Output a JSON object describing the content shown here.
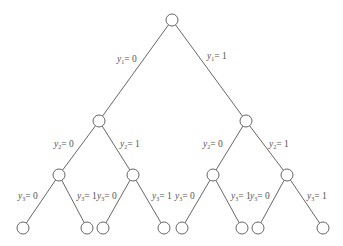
{
  "diagram": {
    "type": "binary-tree",
    "nodes": [
      {
        "id": "root",
        "x": 172,
        "y": 20
      },
      {
        "id": "L",
        "x": 99,
        "y": 121
      },
      {
        "id": "R",
        "x": 246,
        "y": 121
      },
      {
        "id": "LL",
        "x": 59,
        "y": 175
      },
      {
        "id": "LR",
        "x": 133,
        "y": 175
      },
      {
        "id": "RL",
        "x": 213,
        "y": 175
      },
      {
        "id": "RR",
        "x": 287,
        "y": 175
      },
      {
        "id": "LLL",
        "x": 23,
        "y": 228
      },
      {
        "id": "LLR",
        "x": 87,
        "y": 228
      },
      {
        "id": "LRL",
        "x": 103,
        "y": 228
      },
      {
        "id": "LRR",
        "x": 164,
        "y": 228
      },
      {
        "id": "RLL",
        "x": 182,
        "y": 228
      },
      {
        "id": "RLR",
        "x": 242,
        "y": 228
      },
      {
        "id": "RRL",
        "x": 258,
        "y": 228
      },
      {
        "id": "RRR",
        "x": 323,
        "y": 228
      }
    ],
    "edges": [
      {
        "from": "root",
        "to": "L",
        "var": "y",
        "sub": "1",
        "val": "= 0",
        "lx": 117,
        "ly": 55
      },
      {
        "from": "root",
        "to": "R",
        "var": "y",
        "sub": "1",
        "val": "= 1",
        "lx": 207,
        "ly": 52
      },
      {
        "from": "L",
        "to": "LL",
        "var": "y",
        "sub": "2",
        "val": "= 0",
        "lx": 54,
        "ly": 140
      },
      {
        "from": "L",
        "to": "LR",
        "var": "y",
        "sub": "2",
        "val": "= 1",
        "lx": 120,
        "ly": 140
      },
      {
        "from": "R",
        "to": "RL",
        "var": "y",
        "sub": "2",
        "val": "= 0",
        "lx": 203,
        "ly": 140
      },
      {
        "from": "R",
        "to": "RR",
        "var": "y",
        "sub": "2",
        "val": "= 1",
        "lx": 269,
        "ly": 140
      },
      {
        "from": "LL",
        "to": "LLL",
        "var": "y",
        "sub": "3",
        "val": "= 0",
        "lx": 18,
        "ly": 192
      },
      {
        "from": "LL",
        "to": "LLR",
        "var": "y",
        "sub": "3",
        "val": "= 1",
        "lx": 77,
        "ly": 192
      },
      {
        "from": "LR",
        "to": "LRL",
        "var": "y",
        "sub": "3",
        "val": "= 0",
        "lx": 97,
        "ly": 192
      },
      {
        "from": "LR",
        "to": "LRR",
        "var": "y",
        "sub": "3",
        "val": "= 1",
        "lx": 152,
        "ly": 192
      },
      {
        "from": "RL",
        "to": "RLL",
        "var": "y",
        "sub": "3",
        "val": "= 0",
        "lx": 175,
        "ly": 192
      },
      {
        "from": "RL",
        "to": "RLR",
        "var": "y",
        "sub": "3",
        "val": "= 1",
        "lx": 231,
        "ly": 192
      },
      {
        "from": "RR",
        "to": "RRL",
        "var": "y",
        "sub": "3",
        "val": "= 0",
        "lx": 250,
        "ly": 192
      },
      {
        "from": "RR",
        "to": "RRR",
        "var": "y",
        "sub": "3",
        "val": "= 1",
        "lx": 307,
        "ly": 192
      }
    ],
    "node_radius": 6,
    "colors": {
      "stroke": "#555555",
      "background": "#ffffff"
    }
  }
}
